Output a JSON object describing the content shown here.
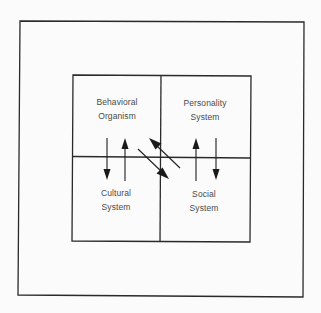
{
  "diagram": {
    "type": "four-quadrant system diagram with interchange arrows",
    "colors": {
      "background": "#fbfbfb",
      "lines": "#2a2a2a",
      "text": "#4a4a4a"
    },
    "quadrants": [
      {
        "id": "top-left",
        "lines": [
          "Behavioral",
          "Organism"
        ]
      },
      {
        "id": "top-right",
        "lines": [
          "Personality",
          "System"
        ]
      },
      {
        "id": "bottom-left",
        "lines": [
          "Cultural",
          "System"
        ]
      },
      {
        "id": "bottom-right",
        "lines": [
          "Social",
          "System"
        ]
      }
    ],
    "arrows": [
      {
        "between": [
          "Behavioral Organism",
          "Cultural System"
        ],
        "direction": "down"
      },
      {
        "between": [
          "Cultural System",
          "Behavioral Organism"
        ],
        "direction": "up"
      },
      {
        "between": [
          "Social System",
          "Behavioral Organism"
        ],
        "direction": "up-left"
      },
      {
        "between": [
          "Behavioral Organism",
          "Social System"
        ],
        "direction": "down-right"
      },
      {
        "between": [
          "Social System",
          "Personality System"
        ],
        "direction": "up"
      },
      {
        "between": [
          "Personality System",
          "Social System"
        ],
        "direction": "down"
      }
    ]
  }
}
